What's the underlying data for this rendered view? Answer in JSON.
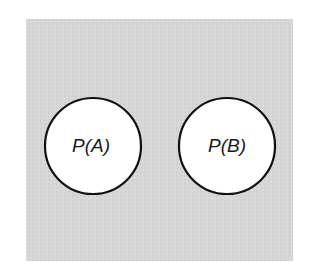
{
  "diagram": {
    "type": "venn-disjoint",
    "background_color": "#d6d6d6",
    "circle_fill": "#ffffff",
    "circle_stroke": "#111111",
    "sets": [
      {
        "label": "P(A)",
        "cx": 93,
        "cy": 146,
        "r": 48
      },
      {
        "label": "P(B)",
        "cx": 227,
        "cy": 146,
        "r": 48
      }
    ]
  }
}
